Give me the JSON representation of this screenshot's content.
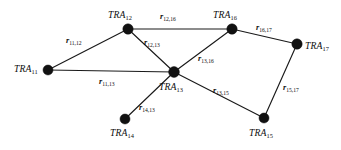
{
  "diagram": {
    "type": "undirected-graph",
    "title": "",
    "background_color": "#ffffff",
    "node_color": "#111111",
    "edge_color": "#1a1a1a",
    "nodes": [
      {
        "id": "TRA11",
        "prefix": "TRA",
        "subscript": "11",
        "x": 48,
        "y": 70,
        "r": 5.0,
        "label_x": 14,
        "label_y": 64
      },
      {
        "id": "TRA12",
        "prefix": "TRA",
        "subscript": "12",
        "x": 128,
        "y": 29,
        "r": 5.2,
        "label_x": 108,
        "label_y": 10
      },
      {
        "id": "TRA13",
        "prefix": "TRA",
        "subscript": "13",
        "x": 174,
        "y": 72,
        "r": 5.4,
        "label_x": 159,
        "label_y": 82
      },
      {
        "id": "TRA14",
        "prefix": "TRA",
        "subscript": "14",
        "x": 125,
        "y": 119,
        "r": 5.0,
        "label_x": 110,
        "label_y": 128
      },
      {
        "id": "TRA15",
        "prefix": "TRA",
        "subscript": "15",
        "x": 264,
        "y": 118,
        "r": 5.0,
        "label_x": 249,
        "label_y": 128
      },
      {
        "id": "TRA16",
        "prefix": "TRA",
        "subscript": "16",
        "x": 232,
        "y": 29,
        "r": 5.2,
        "label_x": 213,
        "label_y": 10
      },
      {
        "id": "TRA17",
        "prefix": "TRA",
        "subscript": "17",
        "x": 297,
        "y": 44,
        "r": 5.2,
        "label_x": 305,
        "label_y": 41
      }
    ],
    "edges": [
      {
        "id": "r11_12",
        "from": "TRA11",
        "to": "TRA12",
        "prefix": "r",
        "subscript": "11,12",
        "label_x": 66,
        "label_y": 37
      },
      {
        "id": "r12_16",
        "from": "TRA12",
        "to": "TRA16",
        "prefix": "r",
        "subscript": "12,16",
        "label_x": 160,
        "label_y": 13
      },
      {
        "id": "r16_17",
        "from": "TRA16",
        "to": "TRA17",
        "prefix": "r",
        "subscript": "16,17",
        "label_x": 256,
        "label_y": 24
      },
      {
        "id": "r12_13",
        "from": "TRA12",
        "to": "TRA13",
        "prefix": "r",
        "subscript": "12,13",
        "label_x": 144,
        "label_y": 39
      },
      {
        "id": "r11_13",
        "from": "TRA11",
        "to": "TRA13",
        "prefix": "r",
        "subscript": "11,13",
        "label_x": 99,
        "label_y": 78
      },
      {
        "id": "r13_16",
        "from": "TRA13",
        "to": "TRA16",
        "prefix": "r",
        "subscript": "13,16",
        "label_x": 198,
        "label_y": 55
      },
      {
        "id": "r14_13",
        "from": "TRA14",
        "to": "TRA13",
        "prefix": "r",
        "subscript": "14,13",
        "label_x": 139,
        "label_y": 104
      },
      {
        "id": "r13_15",
        "from": "TRA13",
        "to": "TRA15",
        "prefix": "r",
        "subscript": "13,15",
        "label_x": 213,
        "label_y": 87
      },
      {
        "id": "r15_17",
        "from": "TRA15",
        "to": "TRA17",
        "prefix": "r",
        "subscript": "15,17",
        "label_x": 283,
        "label_y": 84
      }
    ]
  }
}
